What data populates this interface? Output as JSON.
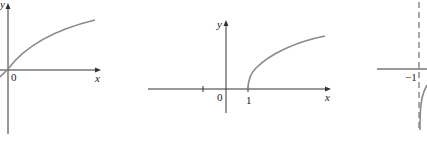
{
  "figure": {
    "colors": {
      "axis": "#333333",
      "curve": "#8a8a8a",
      "asymptote": "#555555"
    },
    "graphs": [
      {
        "id": "graph-a",
        "x_axis_label": "x",
        "y_axis_label": "y",
        "origin_label": "0",
        "curve": "increasing concave curve through origin"
      },
      {
        "id": "graph-b",
        "x_axis_label": "x",
        "y_axis_label": "y",
        "origin_label": "0",
        "tick_labels": [
          "1"
        ],
        "curve": "square-root shaped curve starting at x = 1"
      },
      {
        "id": "graph-c",
        "tick_labels": [
          "−1"
        ],
        "asymptote": "vertical dashed line at x = −1",
        "curve": "curve descending along the asymptote"
      }
    ]
  }
}
